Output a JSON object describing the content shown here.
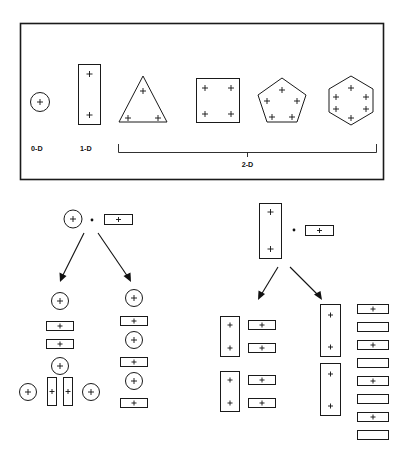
{
  "figure": {
    "background": "#ffffff",
    "ink_color": "#111111"
  },
  "top_panel": {
    "name": "dimension-legend-panel",
    "border_color": "#1a1a1a",
    "labels": {
      "zero_d": "0-D",
      "one_d": "1-D",
      "two_d": "2-D"
    },
    "shapes": [
      {
        "id": "circle",
        "kind": "circle",
        "dimension": "0-D",
        "plus_count": 1
      },
      {
        "id": "bar",
        "kind": "vertical-rectangle",
        "dimension": "1-D",
        "plus_count": 2
      },
      {
        "id": "triangle",
        "kind": "triangle",
        "dimension": "2-D",
        "plus_count": 3
      },
      {
        "id": "square",
        "kind": "square",
        "dimension": "2-D",
        "plus_count": 4
      },
      {
        "id": "pentagon",
        "kind": "pentagon",
        "dimension": "2-D",
        "plus_count": 5
      },
      {
        "id": "hexagon",
        "kind": "hexagon",
        "dimension": "2-D",
        "plus_count": 6
      }
    ],
    "bracket": {
      "label": "2-D",
      "spans": [
        "triangle",
        "square",
        "pentagon",
        "hexagon"
      ]
    }
  },
  "left_tree": {
    "name": "left-decomposition-tree",
    "root": {
      "left_operand": {
        "kind": "circle",
        "plus_count": 1
      },
      "operator": "dot",
      "right_operand": {
        "kind": "horizontal-rectangle",
        "plus_count": 1
      }
    },
    "branches": [
      {
        "name": "left-branch",
        "items": [
          {
            "kind": "circle",
            "plus_count": 1
          },
          {
            "kind": "horizontal-rectangle",
            "plus_count": 1
          },
          {
            "kind": "horizontal-rectangle",
            "plus_count": 1
          },
          {
            "kind": "circle",
            "plus_count": 1
          }
        ],
        "bottom_row": [
          {
            "kind": "circle",
            "plus_count": 1
          },
          {
            "kind": "vertical-bar",
            "plus_count": 1
          },
          {
            "kind": "vertical-bar",
            "plus_count": 1
          },
          {
            "kind": "circle",
            "plus_count": 1
          }
        ]
      },
      {
        "name": "right-branch",
        "items": [
          {
            "kind": "circle",
            "plus_count": 1
          },
          {
            "kind": "horizontal-rectangle",
            "plus_count": 1
          },
          {
            "kind": "circle",
            "plus_count": 1
          },
          {
            "kind": "horizontal-rectangle",
            "plus_count": 1
          },
          {
            "kind": "circle",
            "plus_count": 1
          },
          {
            "kind": "horizontal-rectangle",
            "plus_count": 1
          }
        ]
      }
    ]
  },
  "right_tree": {
    "name": "right-decomposition-tree",
    "root": {
      "left_operand": {
        "kind": "vertical-rectangle",
        "plus_count": 2
      },
      "operator": "dot",
      "right_operand": {
        "kind": "horizontal-rectangle",
        "plus_count": 1
      }
    },
    "branches": [
      {
        "name": "left-branch",
        "columns": [
          {
            "name": "vertical-column",
            "items": [
              {
                "kind": "vertical-rectangle",
                "plus_count": 2
              },
              {
                "kind": "vertical-rectangle",
                "plus_count": 2
              }
            ]
          },
          {
            "name": "horizontal-column",
            "items": [
              {
                "kind": "horizontal-rectangle",
                "plus_count": 1
              },
              {
                "kind": "horizontal-rectangle",
                "plus_count": 1
              },
              {
                "kind": "horizontal-rectangle",
                "plus_count": 1
              },
              {
                "kind": "horizontal-rectangle",
                "plus_count": 1
              }
            ]
          }
        ]
      },
      {
        "name": "right-branch",
        "columns": [
          {
            "name": "vertical-column",
            "items": [
              {
                "kind": "vertical-rectangle",
                "plus_count": 2
              },
              {
                "kind": "vertical-rectangle",
                "plus_count": 2
              }
            ]
          },
          {
            "name": "horizontal-column",
            "items": [
              {
                "kind": "horizontal-rectangle",
                "plus_count": 1
              },
              {
                "kind": "horizontal-rectangle",
                "plus_count": 0
              },
              {
                "kind": "horizontal-rectangle",
                "plus_count": 1
              },
              {
                "kind": "horizontal-rectangle",
                "plus_count": 0
              },
              {
                "kind": "horizontal-rectangle",
                "plus_count": 1
              },
              {
                "kind": "horizontal-rectangle",
                "plus_count": 0
              },
              {
                "kind": "horizontal-rectangle",
                "plus_count": 1
              },
              {
                "kind": "horizontal-rectangle",
                "plus_count": 0
              }
            ]
          }
        ]
      }
    ]
  }
}
